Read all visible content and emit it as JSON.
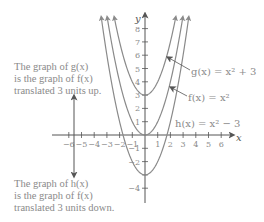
{
  "chart_data": {
    "type": "line",
    "title": "",
    "xlabel": "x",
    "ylabel": "y",
    "xlim": [
      -6.5,
      6.5
    ],
    "ylim": [
      -5,
      9
    ],
    "x_ticks": [
      -6,
      -5,
      -4,
      -3,
      -2,
      -1,
      1,
      2,
      3,
      4,
      5,
      6
    ],
    "x_tick_labels": [
      "−6",
      "−5",
      "−4",
      "−3",
      "−2",
      "−1",
      "1",
      "2",
      "3",
      "4",
      "5",
      "6"
    ],
    "y_ticks": [
      8,
      7,
      6,
      5,
      4,
      3,
      2,
      1,
      -1,
      -2,
      -3,
      -4
    ],
    "y_tick_labels": [
      "8",
      "7",
      "6",
      "5",
      "4",
      "3",
      "2",
      "1",
      "−1",
      "−2",
      "",
      "−4"
    ],
    "grid": false,
    "series": [
      {
        "name": "g",
        "label": "g(x) = x² + 3",
        "formula": "x^2 + 3",
        "shift": 3,
        "color": "#8a8a8a"
      },
      {
        "name": "f",
        "label": "f(x) = x²",
        "formula": "x^2",
        "shift": 0,
        "color": "#8a8a8a"
      },
      {
        "name": "h",
        "label": "h(x) = x² − 3",
        "formula": "x^2 - 3",
        "shift": -3,
        "color": "#8a8a8a"
      }
    ],
    "annotations": [
      {
        "text": "The graph of g(x) is the graph of f(x) translated 3 units up."
      },
      {
        "text": "The graph of h(x) is the graph of f(x) translated 3 units down."
      }
    ]
  },
  "labels": {
    "g": "g(x) = x² + 3",
    "f": "f(x) = x²",
    "h": "h(x) = x² − 3",
    "x_axis": "x",
    "y_axis": "y"
  },
  "notes": {
    "up": [
      "The graph of g(x)",
      "is the graph of f(x)",
      "translated 3 units up."
    ],
    "down": [
      "The graph of h(x)",
      "is the graph of f(x)",
      "translated 3 units down."
    ]
  }
}
